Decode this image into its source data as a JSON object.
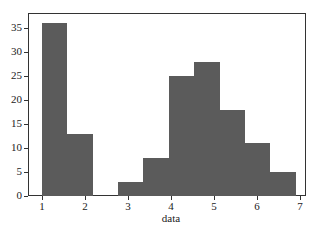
{
  "chart_data": {
    "type": "bar",
    "subtype": "histogram",
    "title": "",
    "xlabel": "data",
    "ylabel": "",
    "bin_edges": [
      1.0,
      1.59,
      2.18,
      2.77,
      3.36,
      3.95,
      4.54,
      5.13,
      5.72,
      6.31,
      6.9
    ],
    "values": [
      36,
      13,
      0,
      3,
      8,
      25,
      28,
      18,
      11,
      5
    ],
    "xlim": [
      0.68,
      7.15
    ],
    "ylim": [
      0,
      36.2
    ],
    "xticks": [
      "1",
      "2",
      "3",
      "4",
      "5",
      "6",
      "7"
    ],
    "yticks": [
      "0",
      "5",
      "10",
      "15",
      "20",
      "25",
      "30",
      "35"
    ],
    "grid": false,
    "bar_color": "#5b5b5b"
  }
}
